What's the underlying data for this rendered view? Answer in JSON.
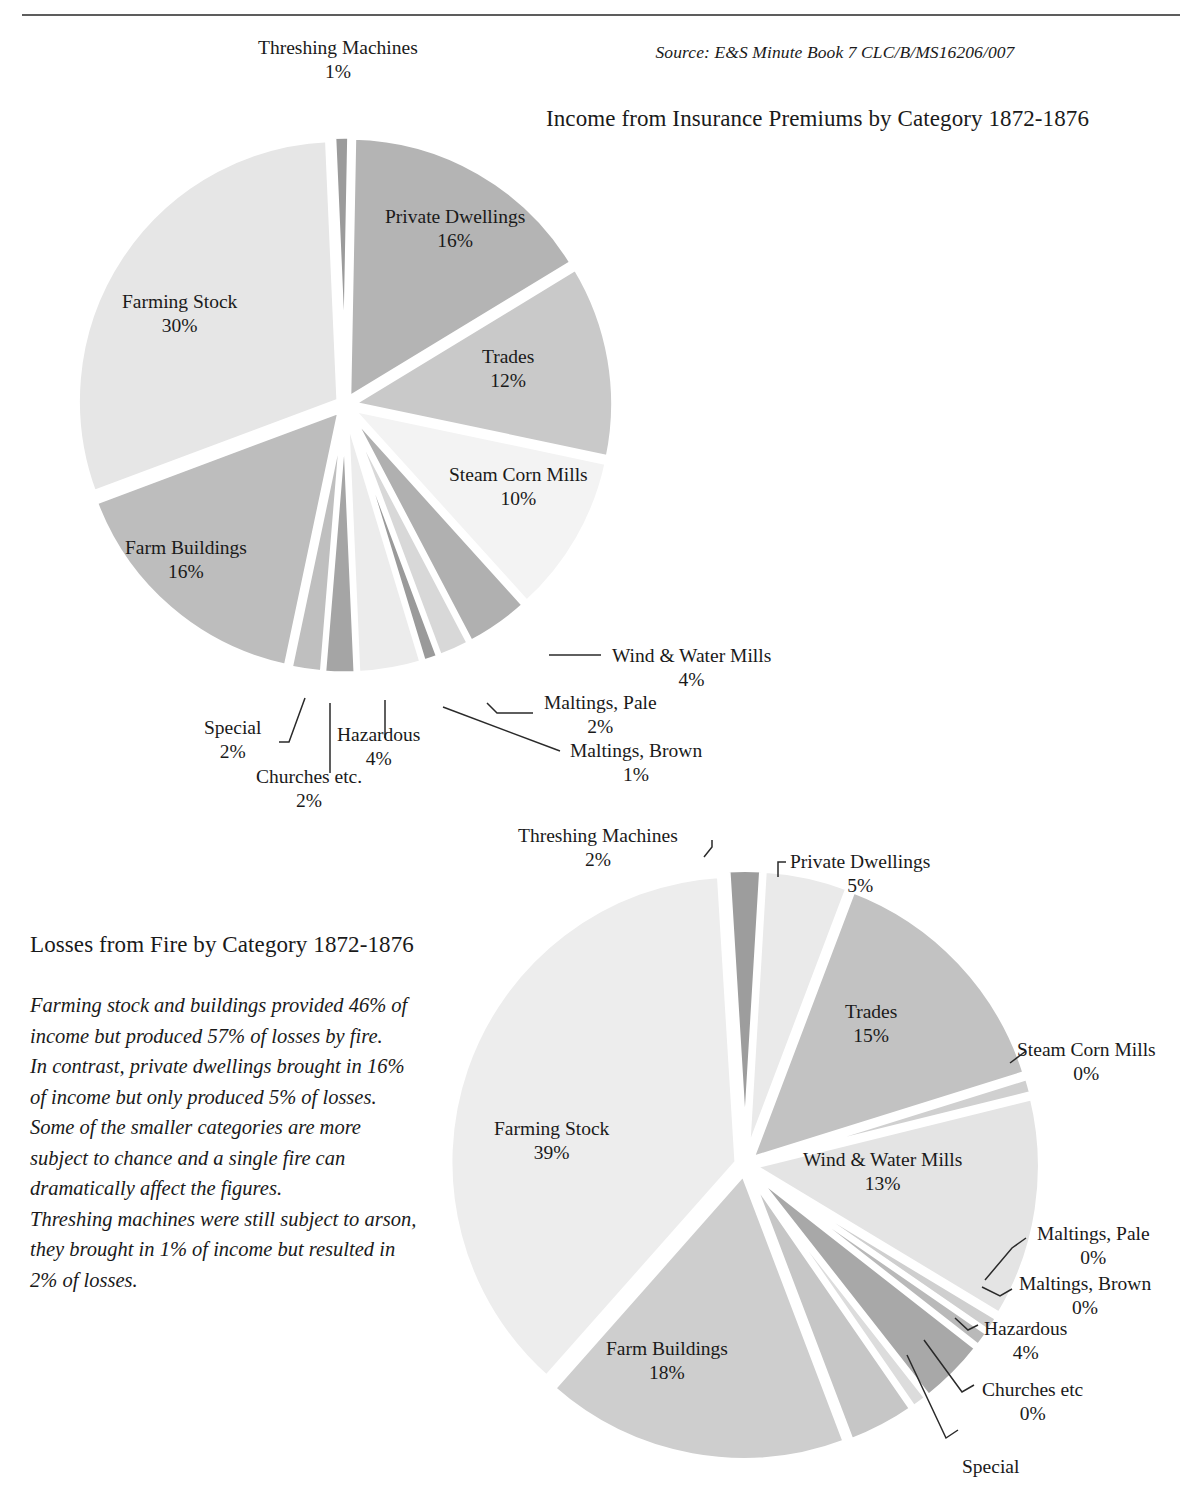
{
  "page": {
    "running_header": "",
    "source_note": "Source: E&S Minute Book 7 CLC/B/MS16206/007"
  },
  "commentary": {
    "para1": "Farming stock and buildings provided 46% of income but produced 57% of losses by fire.",
    "para2": "In contrast, private dwellings brought in 16% of income but only produced 5% of losses.",
    "para3": "Some of the smaller categories are more subject to chance and a single fire can dramatically affect the figures.",
    "para4": "Threshing machines were still subject to arson, they brought in 1% of income but resulted in 2% of losses."
  },
  "chart_data": [
    {
      "type": "pie",
      "id": "income",
      "title": "Income from Insurance Premiums by Category 1872-1876",
      "legend": "none",
      "unit": "%",
      "categories": [
        "Threshing Machines",
        "Private Dwellings",
        "Trades",
        "Steam Corn Mills",
        "Wind & Water Mills",
        "Maltings, Pale",
        "Maltings, Brown",
        "Hazardous",
        "Churches etc.",
        "Special",
        "Farm Buildings",
        "Farming Stock"
      ],
      "values": [
        1,
        16,
        12,
        10,
        4,
        2,
        1,
        4,
        2,
        2,
        16,
        30
      ],
      "labels": [
        {
          "name": "Threshing Machines",
          "pct": "1%"
        },
        {
          "name": "Private Dwellings",
          "pct": "16%"
        },
        {
          "name": "Trades",
          "pct": "12%"
        },
        {
          "name": "Steam Corn Mills",
          "pct": "10%"
        },
        {
          "name": "Wind & Water Mills",
          "pct": "4%"
        },
        {
          "name": "Maltings, Pale",
          "pct": "2%"
        },
        {
          "name": "Maltings, Brown",
          "pct": "1%"
        },
        {
          "name": "Hazardous",
          "pct": "4%"
        },
        {
          "name": "Churches etc.",
          "pct": "2%"
        },
        {
          "name": "Special",
          "pct": "2%"
        },
        {
          "name": "Farm Buildings",
          "pct": "16%"
        },
        {
          "name": "Farming Stock",
          "pct": "30%"
        }
      ],
      "slice_colors": [
        "#9b9b9b",
        "#b4b4b4",
        "#c9c9c9",
        "#f3f3f3",
        "#b0b0b0",
        "#d8d8d8",
        "#9a9a9a",
        "#ececec",
        "#a5a5a5",
        "#bfbfbf",
        "#bdbdbd",
        "#e6e6e6"
      ]
    },
    {
      "type": "pie",
      "id": "losses",
      "title": "Losses from Fire by Category 1872-1876",
      "legend": "none",
      "unit": "%",
      "categories": [
        "Threshing Machines",
        "Private Dwellings",
        "Trades",
        "Steam Corn Mills",
        "Wind & Water Mills",
        "Maltings, Pale",
        "Maltings, Brown",
        "Hazardous",
        "Churches etc",
        "Special",
        "Farm Buildings",
        "Farming Stock"
      ],
      "values": [
        2,
        5,
        15,
        0,
        13,
        0,
        0,
        4,
        0,
        4,
        18,
        39
      ],
      "labels": [
        {
          "name": "Threshing Machines",
          "pct": "2%"
        },
        {
          "name": "Private Dwellings",
          "pct": "5%"
        },
        {
          "name": "Trades",
          "pct": "15%"
        },
        {
          "name": "Steam Corn Mills",
          "pct": "0%"
        },
        {
          "name": "Wind & Water Mills",
          "pct": "13%"
        },
        {
          "name": "Maltings, Pale",
          "pct": "0%"
        },
        {
          "name": "Maltings, Brown",
          "pct": "0%"
        },
        {
          "name": "Hazardous",
          "pct": "4%"
        },
        {
          "name": "Churches etc",
          "pct": "0%"
        },
        {
          "name": "Special",
          "pct": ""
        },
        {
          "name": "Farm Buildings",
          "pct": "18%"
        },
        {
          "name": "Farming Stock",
          "pct": "39%"
        }
      ],
      "slice_colors": [
        "#9d9d9d",
        "#eaeaea",
        "#c2c2c2",
        "#d0d0d0",
        "#e4e4e4",
        "#cfcfcf",
        "#b9b9b9",
        "#a8a8a8",
        "#dcdcdc",
        "#c6c6c6",
        "#cecece",
        "#ededed"
      ]
    }
  ]
}
